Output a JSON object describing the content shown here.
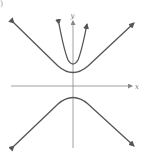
{
  "figure": {
    "panel_label": ")",
    "axes": {
      "x_label": "x",
      "y_label": "y",
      "color": "#888888"
    },
    "curves": [
      {
        "name": "narrow-parabola",
        "vertex": [
          0,
          1.5
        ],
        "opens": "up",
        "color": "#555555"
      },
      {
        "name": "hyperbola-upper-branch",
        "vertex": [
          0,
          1
        ],
        "opens": "up",
        "color": "#555555"
      },
      {
        "name": "hyperbola-lower-branch",
        "vertex": [
          0,
          -1
        ],
        "opens": "down",
        "color": "#555555"
      }
    ]
  }
}
